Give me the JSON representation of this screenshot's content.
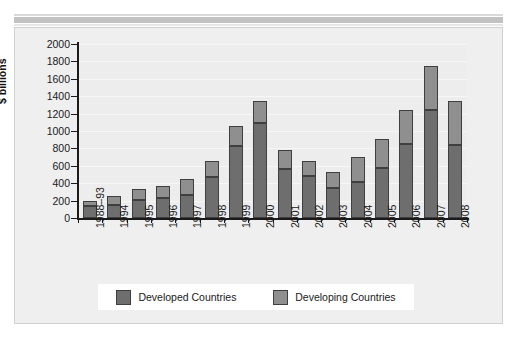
{
  "chart_data": {
    "type": "bar",
    "subtype": "stacked",
    "title": "",
    "xlabel": "",
    "ylabel": "$ billions",
    "ylim": [
      0,
      2000
    ],
    "ytick_step": 200,
    "yticks": [
      2000,
      1800,
      1600,
      1400,
      1200,
      1000,
      800,
      600,
      400,
      200,
      0
    ],
    "grid": true,
    "legend_position": "bottom",
    "categories": [
      "1988–93",
      "1994",
      "1995",
      "1996",
      "1997",
      "1998",
      "1999",
      "2000",
      "2001",
      "2002",
      "2003",
      "2004",
      "2005",
      "2006",
      "2007",
      "2008"
    ],
    "series": [
      {
        "name": "Developed Countries",
        "color": "#6e6e6e",
        "values": [
          140,
          150,
          205,
          225,
          270,
          475,
          830,
          1090,
          565,
          485,
          350,
          415,
          580,
          855,
          1240,
          840
        ]
      },
      {
        "name": "Developing Countries",
        "color": "#8f8f8f",
        "values": [
          60,
          105,
          125,
          140,
          180,
          185,
          230,
          260,
          220,
          165,
          180,
          290,
          325,
          385,
          510,
          510
        ]
      }
    ],
    "totals": [
      200,
      255,
      330,
      365,
      450,
      660,
      1060,
      1350,
      785,
      650,
      530,
      705,
      905,
      1240,
      1750,
      1350
    ]
  },
  "legend": {
    "items": [
      {
        "label": "Developed Countries",
        "swatch": "#6e6e6e"
      },
      {
        "label": "Developing Countries",
        "swatch": "#8f8f8f"
      }
    ]
  },
  "axis": {
    "y_title": "$ billions"
  }
}
